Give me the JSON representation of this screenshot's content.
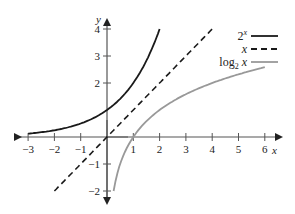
{
  "chart_data": {
    "type": "line",
    "title": "",
    "xlabel": "x",
    "ylabel": "y",
    "xlim": [
      -3.5,
      6.5
    ],
    "ylim": [
      -2.5,
      4.3
    ],
    "x_ticks": [
      -3,
      -2,
      -1,
      1,
      2,
      3,
      4,
      5,
      6
    ],
    "y_ticks": [
      -2,
      -1,
      2,
      3,
      4
    ],
    "grid": false,
    "legend_position": "upper right",
    "series": [
      {
        "name": "2^x",
        "style": "solid",
        "color": "#1a1a1a",
        "function": "2^x",
        "x_range": [
          -3,
          2
        ]
      },
      {
        "name": "x",
        "style": "dashed",
        "color": "#1a1a1a",
        "function": "x",
        "x_range": [
          -2,
          4
        ]
      },
      {
        "name": "log2 x",
        "style": "solid",
        "color": "#999999",
        "function": "log2(x)",
        "x_range": [
          0.25,
          6
        ]
      }
    ]
  },
  "legend": {
    "items": [
      {
        "label": "2",
        "sup": "x"
      },
      {
        "label": "x",
        "sup": ""
      },
      {
        "label": "log",
        "sub": "2",
        "suffix": " x"
      }
    ]
  },
  "axes": {
    "x_label": "x",
    "y_label": "y",
    "x_tick_labels": [
      "−3",
      "−2",
      "−1",
      "1",
      "2",
      "3",
      "4",
      "5",
      "6"
    ],
    "y_tick_labels": [
      "−2",
      "−1",
      "2",
      "3",
      "4"
    ]
  }
}
